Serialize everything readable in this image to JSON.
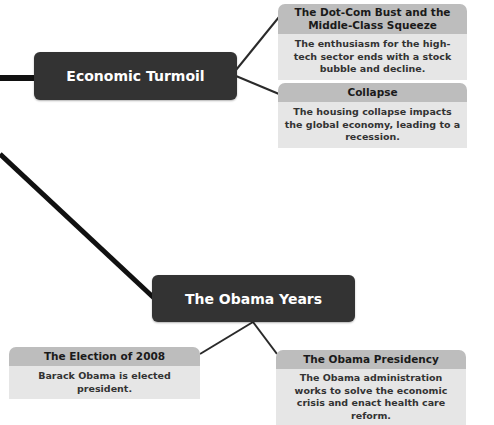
{
  "colors": {
    "main_node": "#333333",
    "card_header": "#bdbdbd",
    "card_body": "#e6e6e6",
    "line": "#111111"
  },
  "nodes": {
    "economic_turmoil": {
      "title": "Economic Turmoil",
      "children": [
        {
          "title": "The Dot-Com Bust and the Middle-Class Squeeze",
          "body": "The enthusiasm for the high-tech sector ends with a stock bubble and decline."
        },
        {
          "title": "Collapse",
          "body": "The housing collapse impacts the global economy, leading to a recession."
        }
      ]
    },
    "obama_years": {
      "title": "The Obama Years",
      "children": [
        {
          "title": "The Election of 2008",
          "body": "Barack Obama is elected president."
        },
        {
          "title": "The Obama Presidency",
          "body": "The Obama administration works to solve the economic crisis and enact health care reform."
        }
      ]
    }
  }
}
